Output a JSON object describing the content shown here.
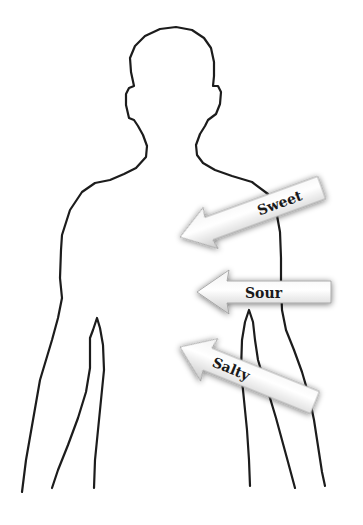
{
  "figure": {
    "outline_color": "#1c1c1c",
    "background": "#ffffff"
  },
  "arrows": [
    {
      "label": "Sweet",
      "direction": "left-down",
      "angle_deg": -20
    },
    {
      "label": "Sour",
      "direction": "left",
      "angle_deg": 0
    },
    {
      "label": "Salty",
      "direction": "left-up",
      "angle_deg": 20
    }
  ],
  "colors": {
    "arrow_fill_light": "#ffffff",
    "arrow_fill_dark": "#cfcfcf",
    "arrow_shadow": "#7a7a7a",
    "text": "#1a1a1a"
  }
}
